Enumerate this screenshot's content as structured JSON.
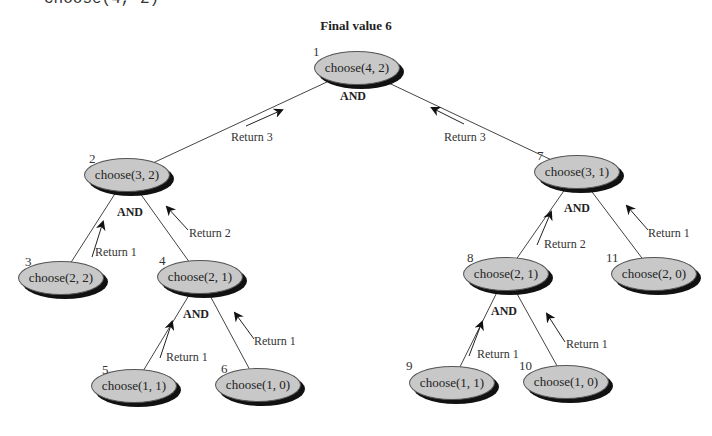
{
  "header": {
    "cut_text": "choose(4, 2)"
  },
  "title": "Final value 6",
  "and_label": "AND",
  "nodes": [
    {
      "id": 1,
      "num": "1",
      "label": "choose(4, 2)",
      "cx": 357,
      "cy": 68,
      "nx": 313,
      "ny": 44
    },
    {
      "id": 2,
      "num": "2",
      "label": "choose(3, 2)",
      "cx": 127,
      "cy": 175,
      "nx": 89,
      "ny": 151
    },
    {
      "id": 3,
      "num": "3",
      "label": "choose(2, 2)",
      "cx": 61,
      "cy": 278,
      "nx": 25,
      "ny": 254
    },
    {
      "id": 4,
      "num": "4",
      "label": "choose(2, 1)",
      "cx": 200,
      "cy": 277,
      "nx": 159,
      "ny": 253
    },
    {
      "id": 5,
      "num": "5",
      "label": "choose(1, 1)",
      "cx": 134,
      "cy": 386,
      "nx": 102,
      "ny": 362
    },
    {
      "id": 6,
      "num": "6",
      "label": "choose(1, 0)",
      "cx": 258,
      "cy": 385,
      "nx": 221,
      "ny": 361
    },
    {
      "id": 7,
      "num": "7",
      "label": "choose(3, 1)",
      "cx": 577,
      "cy": 172,
      "nx": 537,
      "ny": 148
    },
    {
      "id": 8,
      "num": "8",
      "label": "choose(2, 1)",
      "cx": 506,
      "cy": 274,
      "nx": 467,
      "ny": 250
    },
    {
      "id": 9,
      "num": "9",
      "label": "choose(1, 1)",
      "cx": 452,
      "cy": 383,
      "nx": 406,
      "ny": 358
    },
    {
      "id": 10,
      "num": "10",
      "label": "choose(1, 0)",
      "cx": 566,
      "cy": 382,
      "nx": 519,
      "ny": 358
    },
    {
      "id": 11,
      "num": "11",
      "label": "choose(2, 0)",
      "cx": 654,
      "cy": 274,
      "nx": 606,
      "ny": 250
    }
  ],
  "edges": [
    {
      "from": 1,
      "to": 2
    },
    {
      "from": 1,
      "to": 7
    },
    {
      "from": 2,
      "to": 3
    },
    {
      "from": 2,
      "to": 4
    },
    {
      "from": 4,
      "to": 5
    },
    {
      "from": 4,
      "to": 6
    },
    {
      "from": 7,
      "to": 8
    },
    {
      "from": 7,
      "to": 11
    },
    {
      "from": 8,
      "to": 9
    },
    {
      "from": 8,
      "to": 10
    }
  ],
  "and_labels": [
    {
      "x": 340,
      "y": 89
    },
    {
      "x": 117,
      "y": 205
    },
    {
      "x": 183,
      "y": 307
    },
    {
      "x": 564,
      "y": 201
    },
    {
      "x": 491,
      "y": 304
    }
  ],
  "returns": [
    {
      "text": "Return 3",
      "lx": 231,
      "ly": 130,
      "ax1": 246,
      "ay1": 126,
      "ax2": 282,
      "ay2": 110
    },
    {
      "text": "Return 3",
      "lx": 444,
      "ly": 130,
      "ax1": 464,
      "ay1": 124,
      "ax2": 432,
      "ay2": 108
    },
    {
      "text": "Return 1",
      "lx": 95,
      "ly": 245,
      "ax1": 92,
      "ay1": 257,
      "ax2": 103,
      "ay2": 222
    },
    {
      "text": "Return 2",
      "lx": 189,
      "ly": 226,
      "ax1": 188,
      "ay1": 230,
      "ax2": 167,
      "ay2": 207
    },
    {
      "text": "Return 1",
      "lx": 166,
      "ly": 350,
      "ax1": 160,
      "ay1": 358,
      "ax2": 172,
      "ay2": 322
    },
    {
      "text": "Return 1",
      "lx": 254,
      "ly": 334,
      "ax1": 254,
      "ay1": 339,
      "ax2": 235,
      "ay2": 313
    },
    {
      "text": "Return 2",
      "lx": 544,
      "ly": 237,
      "ax1": 537,
      "ay1": 245,
      "ax2": 551,
      "ay2": 212
    },
    {
      "text": "Return 1",
      "lx": 648,
      "ly": 226,
      "ax1": 648,
      "ay1": 230,
      "ax2": 627,
      "ay2": 206
    },
    {
      "text": "Return 1",
      "lx": 477,
      "ly": 347,
      "ax1": 469,
      "ay1": 356,
      "ax2": 482,
      "ay2": 322
    },
    {
      "text": "Return 1",
      "lx": 566,
      "ly": 337,
      "ax1": 565,
      "ay1": 342,
      "ax2": 547,
      "ay2": 314
    }
  ],
  "colors": {
    "node_fill": "#c8c8c8",
    "node_shadow": "#111111",
    "line": "#444444"
  }
}
